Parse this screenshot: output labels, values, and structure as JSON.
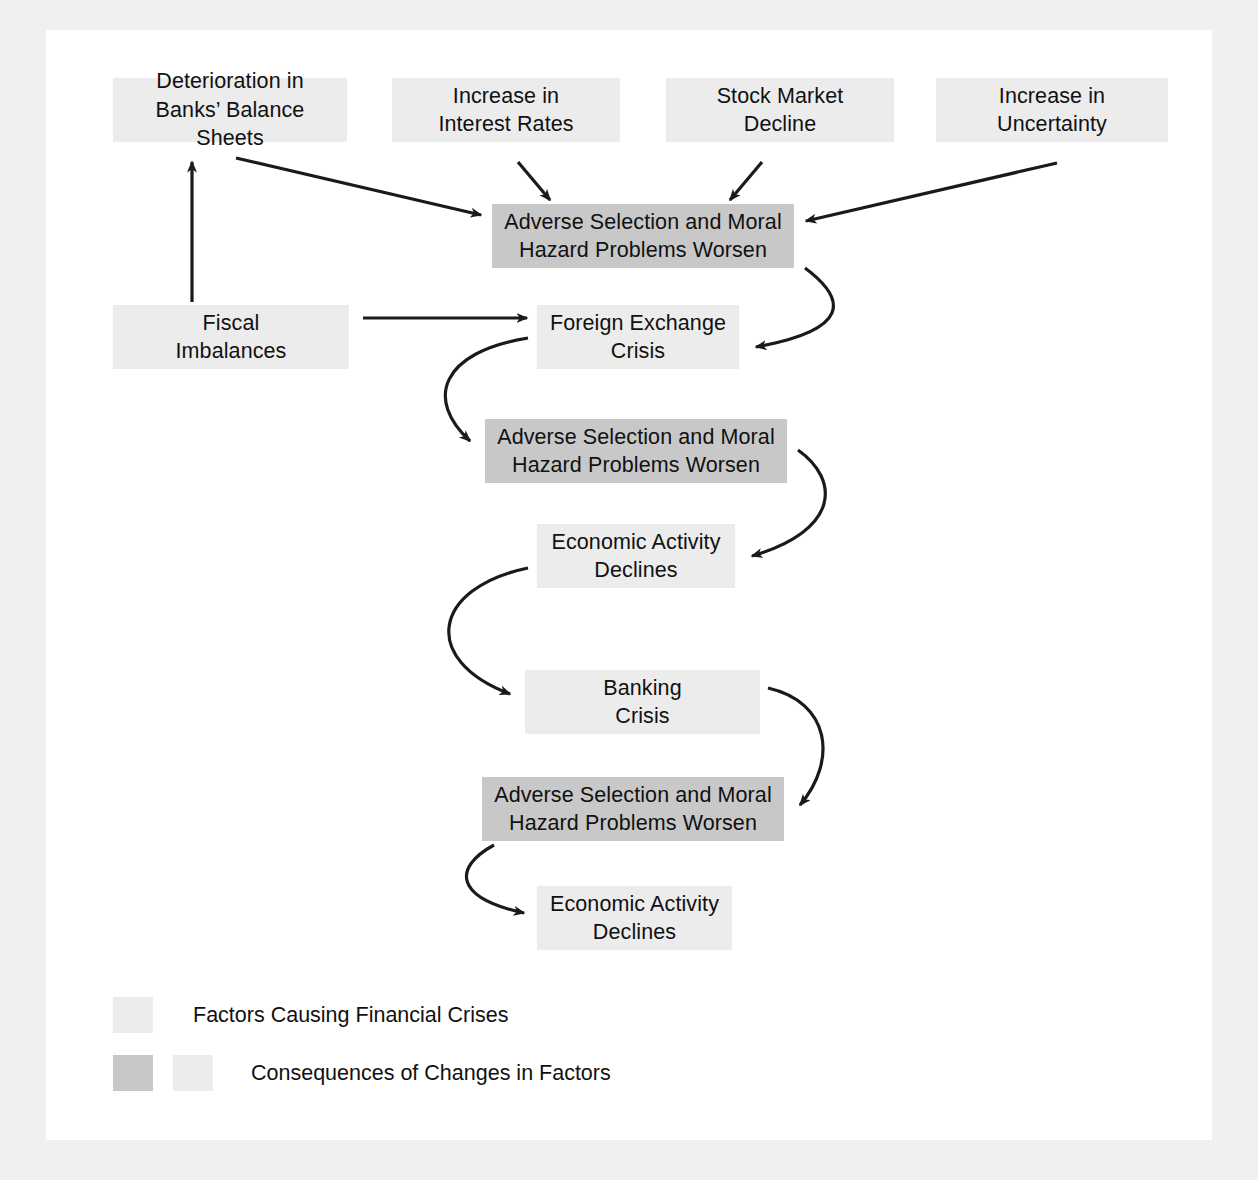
{
  "figure": {
    "background_color": "#f0f0f0",
    "panel_color": "#ffffff",
    "light_box_color": "#ececec",
    "shaded_box_color": "#c8c8c8",
    "arrow_color": "#1a1a1a"
  },
  "nodes": [
    {
      "id": "deterioration-banks",
      "label": "Deterioration in\nBanks’ Balance Sheets",
      "style": "light",
      "x": 113,
      "y": 78,
      "w": 234,
      "h": 64
    },
    {
      "id": "increase-interest-rates",
      "label": "Increase in\nInterest Rates",
      "style": "light",
      "x": 392,
      "y": 78,
      "w": 228,
      "h": 64
    },
    {
      "id": "stock-market-decline",
      "label": "Stock Market\nDecline",
      "style": "light",
      "x": 666,
      "y": 78,
      "w": 228,
      "h": 64
    },
    {
      "id": "increase-uncertainty",
      "label": "Increase in\nUncertainty",
      "style": "light",
      "x": 936,
      "y": 78,
      "w": 232,
      "h": 64
    },
    {
      "id": "adverse-1",
      "label": "Adverse Selection and Moral\nHazard Problems Worsen",
      "style": "shaded",
      "x": 492,
      "y": 204,
      "w": 302,
      "h": 64
    },
    {
      "id": "fiscal-imbalances",
      "label": "Fiscal\nImbalances",
      "style": "light",
      "x": 113,
      "y": 305,
      "w": 236,
      "h": 64
    },
    {
      "id": "foreign-exchange-crisis",
      "label": "Foreign Exchange\nCrisis",
      "style": "light",
      "x": 537,
      "y": 305,
      "w": 202,
      "h": 64
    },
    {
      "id": "adverse-2",
      "label": "Adverse Selection and Moral\nHazard Problems Worsen",
      "style": "shaded",
      "x": 485,
      "y": 419,
      "w": 302,
      "h": 64
    },
    {
      "id": "economic-activity-1",
      "label": "Economic Activity\nDeclines",
      "style": "light",
      "x": 537,
      "y": 524,
      "w": 198,
      "h": 64
    },
    {
      "id": "banking-crisis",
      "label": "Banking\nCrisis",
      "style": "light",
      "x": 525,
      "y": 670,
      "w": 235,
      "h": 64
    },
    {
      "id": "adverse-3",
      "label": "Adverse Selection and Moral\nHazard Problems Worsen",
      "style": "shaded",
      "x": 482,
      "y": 777,
      "w": 302,
      "h": 64
    },
    {
      "id": "economic-activity-2",
      "label": "Economic Activity\nDeclines",
      "style": "light",
      "x": 537,
      "y": 886,
      "w": 195,
      "h": 64
    }
  ],
  "edges": [
    {
      "id": "deterioration-to-adverse1",
      "from": "deterioration-banks",
      "to": "adverse-1",
      "kind": "straight"
    },
    {
      "id": "interest-to-adverse1",
      "from": "increase-interest-rates",
      "to": "adverse-1",
      "kind": "straight"
    },
    {
      "id": "stock-to-adverse1",
      "from": "stock-market-decline",
      "to": "adverse-1",
      "kind": "straight"
    },
    {
      "id": "uncertainty-to-adverse1",
      "from": "increase-uncertainty",
      "to": "adverse-1",
      "kind": "straight"
    },
    {
      "id": "fiscal-to-deterioration",
      "from": "fiscal-imbalances",
      "to": "deterioration-banks",
      "kind": "straight"
    },
    {
      "id": "fiscal-to-fx",
      "from": "fiscal-imbalances",
      "to": "foreign-exchange-crisis",
      "kind": "straight"
    },
    {
      "id": "adverse1-to-fx",
      "from": "adverse-1",
      "to": "foreign-exchange-crisis",
      "kind": "curved"
    },
    {
      "id": "fx-to-adverse2",
      "from": "foreign-exchange-crisis",
      "to": "adverse-2",
      "kind": "curved"
    },
    {
      "id": "adverse2-to-econ1",
      "from": "adverse-2",
      "to": "economic-activity-1",
      "kind": "curved"
    },
    {
      "id": "econ1-to-banking",
      "from": "economic-activity-1",
      "to": "banking-crisis",
      "kind": "curved"
    },
    {
      "id": "banking-to-adverse3",
      "from": "banking-crisis",
      "to": "adverse-3",
      "kind": "curved"
    },
    {
      "id": "adverse3-to-econ2",
      "from": "adverse-3",
      "to": "economic-activity-2",
      "kind": "curved"
    }
  ],
  "legend": {
    "rows": [
      {
        "id": "legend-factors",
        "label": "Factors Causing Financial Crises",
        "swatches": [
          "light"
        ]
      },
      {
        "id": "legend-consequences",
        "label": "Consequences of Changes in Factors",
        "swatches": [
          "shaded",
          "light"
        ]
      }
    ]
  }
}
